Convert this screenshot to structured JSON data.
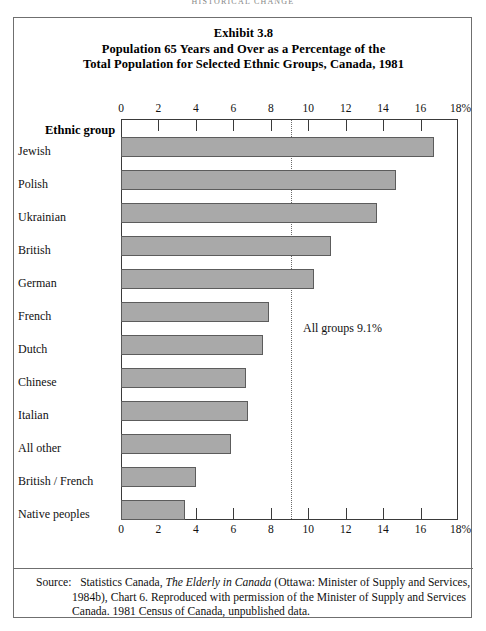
{
  "page_header": "HISTORICAL CHANGE",
  "title": {
    "line1": "Exhibit 3.8",
    "line2": "Population 65 Years and Over as a Percentage of the",
    "line3": "Total Population for Selected Ethnic Groups, Canada, 1981"
  },
  "category_header": "Ethnic group",
  "annotation": "All groups 9.1%",
  "source": {
    "label": "Source:",
    "text_before_italic": "Statistics Canada, ",
    "italic": "The Elderly in Canada",
    "text_after_italic": " (Ottawa: Minister of Supply and Services, 1984b), Chart 6. Reproduced with permission of the Minister of Supply and Services Canada. 1981 Census of Canada, unpublished data."
  },
  "colors": {
    "bar_fill": "#a9a9a9",
    "bar_border": "#5c5c5c",
    "frame": "#6f6f6f",
    "axis": "#3a3a3a",
    "reference_line": "#6a6a6a",
    "text": "#111111",
    "background": "#ffffff"
  },
  "chart_data": {
    "type": "bar",
    "orientation": "horizontal",
    "xlabel": "",
    "ylabel": "Ethnic group",
    "xlim": [
      0,
      18
    ],
    "xticks": [
      0,
      2,
      4,
      6,
      8,
      10,
      12,
      14,
      16,
      18
    ],
    "xtick_labels": [
      "0",
      "2",
      "4",
      "6",
      "8",
      "10",
      "12",
      "14",
      "16",
      "18%"
    ],
    "grid": false,
    "legend": null,
    "units": "percent",
    "categories": [
      "Jewish",
      "Polish",
      "Ukrainian",
      "British",
      "German",
      "French",
      "Dutch",
      "Chinese",
      "Italian",
      "All other",
      "British / French",
      "Native peoples"
    ],
    "values": [
      16.7,
      14.7,
      13.7,
      11.2,
      10.3,
      7.9,
      7.6,
      6.7,
      6.8,
      5.9,
      4.0,
      3.4
    ],
    "annotations": [
      {
        "text": "All groups 9.1%",
        "type": "reference-line",
        "value": 9.1,
        "line_style": "dotted"
      }
    ]
  }
}
